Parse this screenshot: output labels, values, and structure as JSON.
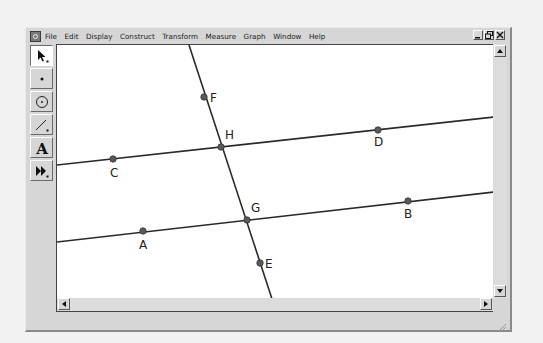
{
  "menubar": {
    "items": [
      "File",
      "Edit",
      "Display",
      "Construct",
      "Transform",
      "Measure",
      "Graph",
      "Window",
      "Help"
    ]
  },
  "window_controls": {
    "minimize": "_",
    "restore": "❐",
    "close": "×"
  },
  "toolbox": {
    "tools": [
      {
        "name": "arrow-tool",
        "icon": "arrow-icon",
        "active": true
      },
      {
        "name": "point-tool",
        "icon": "point-icon",
        "active": false
      },
      {
        "name": "compass-tool",
        "icon": "compass-icon",
        "active": false
      },
      {
        "name": "straightedge-tool",
        "icon": "straightedge-icon",
        "active": false
      },
      {
        "name": "text-tool",
        "icon": "text-icon",
        "active": false,
        "glyph": "A"
      },
      {
        "name": "custom-tool",
        "icon": "custom-tool-icon",
        "active": false
      }
    ]
  },
  "canvas": {
    "points": [
      {
        "label": "F",
        "x": 147,
        "y": 52
      },
      {
        "label": "H",
        "x": 164,
        "y": 102
      },
      {
        "label": "D",
        "x": 321,
        "y": 85
      },
      {
        "label": "C",
        "x": 56,
        "y": 114
      },
      {
        "label": "G",
        "x": 190,
        "y": 175
      },
      {
        "label": "B",
        "x": 351,
        "y": 156
      },
      {
        "label": "A",
        "x": 86,
        "y": 186
      },
      {
        "label": "E",
        "x": 203,
        "y": 218
      }
    ],
    "lines": [
      {
        "name": "line-CD",
        "x1": 0,
        "y1": 120,
        "x2": 437,
        "y2": 72
      },
      {
        "name": "line-AB",
        "x1": 0,
        "y1": 197,
        "x2": 437,
        "y2": 147
      },
      {
        "name": "line-FE",
        "x1": 132,
        "y1": 0,
        "x2": 216,
        "y2": 257
      }
    ],
    "line_color": "#2a2a2a",
    "point_color": "#5a5a5a"
  },
  "scrollbars": {
    "up": "▲",
    "down": "▼",
    "left": "◀",
    "right": "▶"
  }
}
